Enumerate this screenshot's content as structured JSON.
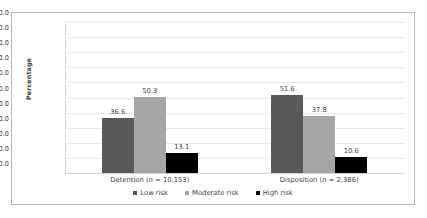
{
  "chart_data": {
    "type": "bar",
    "title": "",
    "subtitle": "",
    "xlabel": "",
    "ylabel": "Percentage",
    "ylim": [
      0,
      100
    ],
    "ytick_step": 10,
    "ytick_labels": [
      "0.0",
      "10.0",
      "20.0",
      "30.0",
      "40.0",
      "50.0",
      "60.0",
      "70.0",
      "80.0",
      "90.0",
      "100.0"
    ],
    "grid": true,
    "legend_position": "bottom-center",
    "categories": [
      "Detention (n = 10,153)",
      "Disposition (n = 2,386)"
    ],
    "category_parts": [
      {
        "name": "Detention",
        "n_prefix": "(",
        "n_symbol": "n",
        "n_value": " = 10,153)"
      },
      {
        "name": "Disposition",
        "n_prefix": "(",
        "n_symbol": "n",
        "n_value": " = 2,386)"
      }
    ],
    "series": [
      {
        "name": "Low risk",
        "color": "#595959",
        "values": [
          36.6,
          50.3
        ],
        "labels": [
          "36.6",
          "51.6"
        ]
      },
      {
        "name": "Moderate risk",
        "color": "#a6a6a6",
        "values": [
          50.3,
          37.8
        ],
        "labels": [
          "50.3",
          "37.8"
        ]
      },
      {
        "name": "High risk",
        "color": "#000000",
        "values": [
          13.1,
          10.6
        ],
        "labels": [
          "13.1",
          "10.6"
        ]
      }
    ],
    "data_table": [
      {
        "category": "Detention (n = 10,153)",
        "Low risk": 36.6,
        "Moderate risk": 50.3,
        "High risk": 13.1
      },
      {
        "category": "Disposition (n = 2,386)",
        "Low risk": 51.6,
        "Moderate risk": 37.8,
        "High risk": 10.6
      }
    ]
  },
  "legend": {
    "items": [
      {
        "label": "Low risk",
        "color": "#595959",
        "marker": "square-marker-icon"
      },
      {
        "label": "Moderate risk",
        "color": "#a6a6a6",
        "marker": "square-marker-icon"
      },
      {
        "label": "High risk",
        "color": "#000000",
        "marker": "square-marker-icon"
      }
    ]
  },
  "axis": {
    "y_title": "Percentage"
  },
  "colors": {
    "low_risk": "#595959",
    "moderate_risk": "#a6a6a6",
    "high_risk": "#000000",
    "gridline": "#e8e8e8",
    "frame": "#b7b7b7",
    "text": "#3f3f3f",
    "background": "#ffffff"
  }
}
